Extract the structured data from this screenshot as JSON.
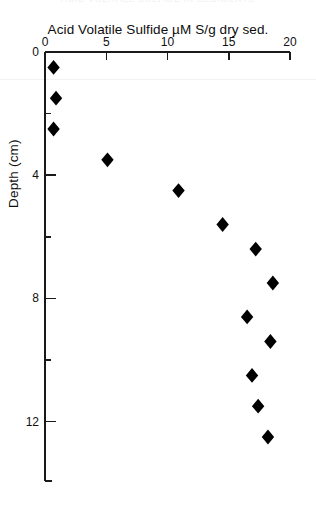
{
  "figure": {
    "ghost_caption": "ACID VOLATILE SULFIDE IN SEDIMENTS",
    "axis_title": "Acid Volatile Sulfide    µM S/g dry sed.",
    "y_axis_title": "Depth (cm)"
  },
  "chart_data": {
    "type": "scatter",
    "title": "Acid Volatile Sulfide    µM S/g dry sed.",
    "xlabel": "Acid Volatile Sulfide  µM S/g dry sed.",
    "ylabel": "Depth (cm)",
    "xlim": [
      0,
      20
    ],
    "ylim": [
      0,
      14.2
    ],
    "y_inverted": true,
    "x_axis_position": "top",
    "grid": false,
    "legend": null,
    "marker": "filled-diamond",
    "marker_color": "#000000",
    "x_ticks": [
      0,
      5,
      10,
      15,
      20
    ],
    "x_tick_labels": [
      "0",
      "5",
      "10",
      "15",
      "20"
    ],
    "x_minor_ticks": [],
    "y_ticks": [
      0,
      4,
      8,
      12
    ],
    "y_tick_labels": [
      "0",
      "4",
      "8",
      "12"
    ],
    "y_minor_ticks": [
      2,
      6,
      10
    ],
    "points": [
      {
        "x": 0.7,
        "y": 0.5
      },
      {
        "x": 0.9,
        "y": 1.5
      },
      {
        "x": 0.7,
        "y": 2.5
      },
      {
        "x": 5.1,
        "y": 3.5
      },
      {
        "x": 10.9,
        "y": 4.5
      },
      {
        "x": 14.5,
        "y": 5.6
      },
      {
        "x": 17.2,
        "y": 6.4
      },
      {
        "x": 18.6,
        "y": 7.5
      },
      {
        "x": 16.5,
        "y": 8.6
      },
      {
        "x": 18.4,
        "y": 9.4
      },
      {
        "x": 16.9,
        "y": 10.5
      },
      {
        "x": 17.4,
        "y": 11.5
      },
      {
        "x": 18.2,
        "y": 12.5
      }
    ],
    "series": [
      {
        "name": "Acid volatile sulfide",
        "x": [
          0.7,
          0.9,
          0.7,
          5.1,
          10.9,
          14.5,
          17.2,
          18.6,
          16.5,
          18.4,
          16.9,
          17.4,
          18.2
        ],
        "y": [
          0.5,
          1.5,
          2.5,
          3.5,
          4.5,
          5.6,
          6.4,
          7.5,
          8.6,
          9.4,
          10.5,
          11.5,
          12.5
        ]
      }
    ]
  },
  "geometry": {
    "x0_px": 45,
    "x1_px": 290,
    "x_min": 0,
    "x_max": 20,
    "y0_px": 52,
    "y_px_per_unit": 30.8,
    "axis_bottom_px": 481
  }
}
